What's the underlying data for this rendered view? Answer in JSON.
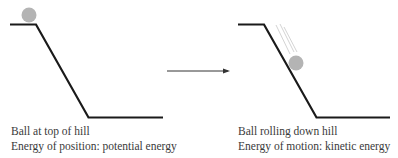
{
  "diagram": {
    "left_panel": {
      "caption_line1": "Ball at top of hill",
      "caption_line2": "Energy of position: potential energy"
    },
    "right_panel": {
      "caption_line1": "Ball rolling down hill",
      "caption_line2": "Energy of motion: kinetic energy"
    },
    "colors": {
      "hill": "#1a1a1a",
      "ball": "#b4b4b4",
      "arrow": "#333333",
      "motion_lines": "#c8c8c8",
      "text": "#3a3a3a"
    }
  }
}
